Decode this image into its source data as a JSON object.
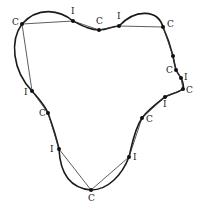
{
  "figure": {
    "curve_color": "#1a1a1a",
    "chord_color": "#333333",
    "point_color": "#111111"
  },
  "points": [
    {
      "id": "p1",
      "label": "C",
      "x": 22,
      "y": 24,
      "lx": 12,
      "ly": 25
    },
    {
      "id": "p2",
      "label": "I",
      "x": 73,
      "y": 21,
      "lx": 71,
      "ly": 14
    },
    {
      "id": "p3",
      "label": "C",
      "x": 99,
      "y": 30,
      "lx": 96,
      "ly": 24
    },
    {
      "id": "p4",
      "label": "I",
      "x": 119,
      "y": 26,
      "lx": 117,
      "ly": 19
    },
    {
      "id": "p5",
      "label": "C",
      "x": 163,
      "y": 27,
      "lx": 167,
      "ly": 27
    },
    {
      "id": "p6",
      "label": "",
      "x": 173,
      "y": 56,
      "lx": 0,
      "ly": 0
    },
    {
      "id": "p7",
      "label": "C",
      "x": 176,
      "y": 70,
      "lx": 166,
      "ly": 73
    },
    {
      "id": "p8",
      "label": "I",
      "x": 181,
      "y": 78,
      "lx": 184,
      "ly": 80
    },
    {
      "id": "p9",
      "label": "C",
      "x": 183,
      "y": 89,
      "lx": 186,
      "ly": 93
    },
    {
      "id": "p10",
      "label": "I",
      "x": 165,
      "y": 97,
      "lx": 163,
      "ly": 107
    },
    {
      "id": "p11",
      "label": "C",
      "x": 142,
      "y": 118,
      "lx": 146,
      "ly": 122
    },
    {
      "id": "p12",
      "label": "I",
      "x": 129,
      "y": 157,
      "lx": 133,
      "ly": 160
    },
    {
      "id": "p13",
      "label": "C",
      "x": 91,
      "y": 190,
      "lx": 88,
      "ly": 201
    },
    {
      "id": "p14",
      "label": "I",
      "x": 59,
      "y": 149,
      "lx": 50,
      "ly": 152
    },
    {
      "id": "p15",
      "label": "C",
      "x": 48,
      "y": 113,
      "lx": 39,
      "ly": 116
    },
    {
      "id": "p16",
      "label": "I",
      "x": 32,
      "y": 91,
      "lx": 24,
      "ly": 95
    }
  ],
  "labels": {
    "convex": "C",
    "inflection": "I"
  }
}
